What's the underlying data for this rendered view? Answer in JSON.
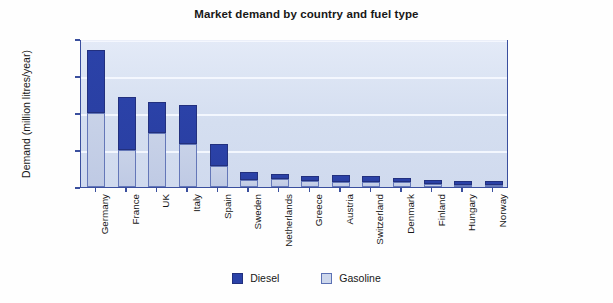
{
  "chart_data": {
    "type": "bar",
    "subtype": "stacked-vertical",
    "title": "Market demand by country and fuel type",
    "xlabel": "",
    "ylabel": "Demand (million litres/year)",
    "ylim": [
      0,
      80000
    ],
    "yticks": [
      "0",
      "20 000",
      "40 000",
      "60 000",
      "80 000"
    ],
    "ytick_values": [
      0,
      20000,
      40000,
      60000,
      80000
    ],
    "grid": true,
    "grid_orientation": "horizontal",
    "legend_position": "bottom-center",
    "categories": [
      "Germany",
      "France",
      "UK",
      "Italy",
      "Spain",
      "Sweden",
      "Netherlands",
      "Greece",
      "Austria",
      "Switzerland",
      "Denmark",
      "Finland",
      "Hungary",
      "Norway"
    ],
    "series": [
      {
        "name": "Diesel",
        "color": "#2b42a8",
        "values": [
          34000,
          28500,
          17000,
          21500,
          12000,
          4000,
          2500,
          3000,
          4000,
          3500,
          2500,
          2500,
          2000,
          2000
        ]
      },
      {
        "name": "Gasoline",
        "color": "#cdd7ec",
        "values": [
          40000,
          20000,
          29000,
          23000,
          11500,
          4000,
          4500,
          3000,
          2500,
          2500,
          2500,
          1500,
          1000,
          1000
        ]
      }
    ],
    "totals": [
      74000,
      48500,
      46000,
      44500,
      23500,
      8000,
      7000,
      6000,
      6500,
      6000,
      5000,
      4000,
      3000,
      3000
    ],
    "colors": {
      "diesel": "#2b42a8",
      "gasoline": "#cdd7ec",
      "plot_background": "#d4def0",
      "plot_border": "#3a4f9e",
      "gridline": "#f4f8fe",
      "text": "#171717"
    }
  },
  "legend": {
    "entries": [
      {
        "label": "Diesel"
      },
      {
        "label": "Gasoline"
      }
    ]
  }
}
